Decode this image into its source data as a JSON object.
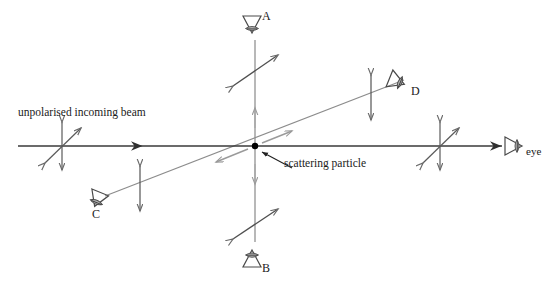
{
  "figure": {
    "background_color": "#ffffff",
    "width": 545,
    "height": 284
  },
  "colors": {
    "beam_line": "#333333",
    "secondary_line": "#8c8c8c",
    "arrow_dark": "#555555",
    "arrow_gray": "#9a9a9a",
    "text": "#1a1a1a",
    "particle": "#000000"
  },
  "labels": {
    "incoming_beam": "unpolarised incoming beam",
    "scattering_particle": "scattering particle",
    "observer_a": "A",
    "observer_b": "B",
    "observer_c": "C",
    "observer_d": "D",
    "observer_eye": "eye"
  },
  "icons": {
    "eye_a": "eye-icon",
    "eye_b": "eye-icon",
    "eye_c": "eye-icon",
    "eye_d": "eye-icon",
    "eye_right": "eye-icon",
    "particle": "dot-icon",
    "leader": "leader-line-icon"
  },
  "geometry": {
    "particle": {
      "x": 255,
      "y": 146
    },
    "beam_axis": {
      "x1": 18,
      "y1": 146,
      "x2": 505,
      "y2": 146
    },
    "vertical_axis": {
      "x1": 255,
      "y1": 40,
      "x2": 255,
      "y2": 242
    },
    "diagonal_axis": {
      "x1": 105,
      "y1": 196,
      "x2": 408,
      "y2": 78
    }
  },
  "polarisation_markers": [
    {
      "name": "incoming-unpolarised",
      "type": "unpolarised",
      "center": {
        "x": 62,
        "y": 146
      },
      "components": [
        "vertical",
        "diagonal-45"
      ]
    },
    {
      "name": "transmitted-unpolarised",
      "type": "unpolarised",
      "center": {
        "x": 440,
        "y": 146
      },
      "components": [
        "vertical",
        "diagonal-45"
      ]
    },
    {
      "name": "observer-a-polarisation",
      "type": "linear",
      "center": {
        "x": 255,
        "y": 70
      },
      "components": [
        "diagonal-45"
      ]
    },
    {
      "name": "observer-b-polarisation",
      "type": "linear",
      "center": {
        "x": 255,
        "y": 223
      },
      "components": [
        "diagonal-45"
      ]
    },
    {
      "name": "observer-c-polarisation",
      "type": "linear",
      "center": {
        "x": 140,
        "y": 188
      },
      "components": [
        "vertical"
      ]
    },
    {
      "name": "observer-d-polarisation",
      "type": "linear",
      "center": {
        "x": 371,
        "y": 97
      },
      "components": [
        "vertical"
      ]
    }
  ],
  "observers": [
    {
      "id": "A",
      "label": "A",
      "position": {
        "x": 252,
        "y": 24
      },
      "direction": "down"
    },
    {
      "id": "B",
      "label": "B",
      "position": {
        "x": 252,
        "y": 258
      },
      "direction": "up"
    },
    {
      "id": "C",
      "label": "C",
      "position": {
        "x": 97,
        "y": 203
      },
      "direction": "up-right"
    },
    {
      "id": "D",
      "label": "D",
      "position": {
        "x": 398,
        "y": 81
      },
      "direction": "down-left"
    },
    {
      "id": "eye",
      "label": "eye",
      "position": {
        "x": 513,
        "y": 146
      },
      "direction": "left"
    }
  ]
}
